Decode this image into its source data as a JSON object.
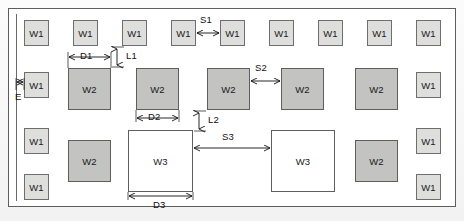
{
  "figure": {
    "frame": {
      "x": 8,
      "y": 8,
      "w": 448,
      "h": 199
    },
    "inner_rule": {
      "x": 16,
      "y": 14,
      "h": 187
    }
  },
  "labels": {
    "w1": "W1",
    "w2": "W2",
    "w3": "W3",
    "s1": "S1",
    "s2": "S2",
    "s3": "S3",
    "d1": "D1",
    "d2": "D2",
    "d3": "D3",
    "l1": "L1",
    "l2": "L2",
    "e": "E"
  },
  "colors": {
    "w1_fill": "#dededd",
    "w2_fill": "#c3c3c2",
    "w3_fill": "#ffffff",
    "stroke": "#5e5e5e",
    "frame_stroke": "#5d5d5d",
    "text": "#111111"
  },
  "shapes": {
    "w1_top_row": [
      {
        "label": "W1",
        "x": 24,
        "y": 20,
        "w": 25,
        "h": 26
      },
      {
        "label": "W1",
        "x": 73,
        "y": 20,
        "w": 25,
        "h": 26
      },
      {
        "label": "W1",
        "x": 122,
        "y": 20,
        "w": 25,
        "h": 26
      },
      {
        "label": "W1",
        "x": 171,
        "y": 20,
        "w": 25,
        "h": 26
      },
      {
        "label": "W1",
        "x": 220,
        "y": 20,
        "w": 25,
        "h": 26
      },
      {
        "label": "W1",
        "x": 269,
        "y": 20,
        "w": 25,
        "h": 26
      },
      {
        "label": "W1",
        "x": 318,
        "y": 20,
        "w": 25,
        "h": 26
      },
      {
        "label": "W1",
        "x": 367,
        "y": 20,
        "w": 25,
        "h": 26
      },
      {
        "label": "W1",
        "x": 416,
        "y": 20,
        "w": 25,
        "h": 26
      }
    ],
    "w2_mid_row": [
      {
        "label": "W2",
        "x": 68,
        "y": 68,
        "w": 43,
        "h": 42
      },
      {
        "label": "W2",
        "x": 136,
        "y": 68,
        "w": 43,
        "h": 42
      },
      {
        "label": "W2",
        "x": 207,
        "y": 68,
        "w": 43,
        "h": 42
      },
      {
        "label": "W2",
        "x": 281,
        "y": 68,
        "w": 43,
        "h": 42
      },
      {
        "label": "W2",
        "x": 355,
        "y": 68,
        "w": 43,
        "h": 42
      }
    ],
    "w1_left_column": [
      {
        "label": "W1",
        "x": 24,
        "y": 72,
        "w": 25,
        "h": 26
      },
      {
        "label": "W1",
        "x": 24,
        "y": 128,
        "w": 25,
        "h": 26
      },
      {
        "label": "W1",
        "x": 24,
        "y": 174,
        "w": 25,
        "h": 26
      }
    ],
    "w1_right_column": [
      {
        "label": "W1",
        "x": 416,
        "y": 72,
        "w": 25,
        "h": 26
      },
      {
        "label": "W1",
        "x": 416,
        "y": 128,
        "w": 25,
        "h": 26
      },
      {
        "label": "W1",
        "x": 416,
        "y": 174,
        "w": 25,
        "h": 26
      }
    ],
    "w2_bottom_row": [
      {
        "label": "W2",
        "x": 68,
        "y": 140,
        "w": 43,
        "h": 42
      },
      {
        "label": "W2",
        "x": 355,
        "y": 140,
        "w": 43,
        "h": 42
      }
    ],
    "w3_row": [
      {
        "label": "W3",
        "x": 128,
        "y": 130,
        "w": 65,
        "h": 62
      },
      {
        "label": "W3",
        "x": 271,
        "y": 130,
        "w": 64,
        "h": 62
      }
    ]
  },
  "dimensions": [
    {
      "name": "S1",
      "label": "S1",
      "type": "horizontal",
      "from_x": 196,
      "to_x": 220,
      "y": 33,
      "label_x": 202,
      "label_y": 14
    },
    {
      "name": "S2",
      "label": "S2",
      "type": "horizontal",
      "from_x": 250,
      "to_x": 281,
      "y": 80,
      "label_x": 256,
      "label_y": 63
    },
    {
      "name": "S3",
      "label": "S3",
      "type": "horizontal",
      "from_x": 193,
      "to_x": 271,
      "y": 148,
      "label_x": 222,
      "label_y": 130
    },
    {
      "name": "D1",
      "label": "D1",
      "type": "horizontal",
      "from_x": 68,
      "to_x": 111,
      "y": 56,
      "label_x": 79,
      "label_y": 49
    },
    {
      "name": "D2",
      "label": "D2",
      "type": "horizontal",
      "from_x": 136,
      "to_x": 179,
      "y": 118,
      "label_x": 147,
      "label_y": 111
    },
    {
      "name": "D3",
      "label": "D3",
      "type": "horizontal",
      "from_x": 128,
      "to_x": 193,
      "y": 196,
      "label_x": 152,
      "label_y": 199
    },
    {
      "name": "L1",
      "label": "L1",
      "type": "vertical",
      "x": 117,
      "from_y": 48,
      "to_y": 66,
      "label_x": 124,
      "label_y": 51
    },
    {
      "name": "L2",
      "label": "L2",
      "type": "vertical",
      "x": 199,
      "from_y": 112,
      "to_y": 130,
      "label_x": 206,
      "label_y": 115
    },
    {
      "name": "E",
      "label": "E",
      "type": "horizontal",
      "from_x": 16,
      "to_x": 24,
      "y": 82,
      "label_x": 16,
      "label_y": 92
    }
  ]
}
